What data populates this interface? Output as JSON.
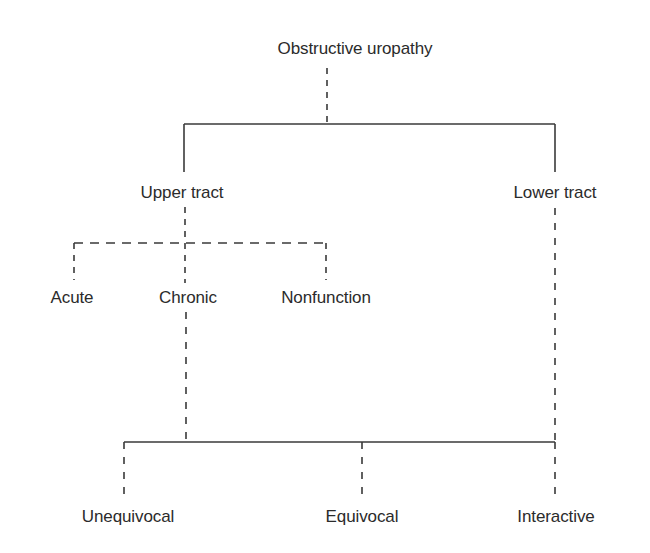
{
  "diagram": {
    "type": "tree",
    "colors": {
      "line": "#3a3a3a",
      "text": "#2b2b2b",
      "background": "#ffffff"
    },
    "nodes": {
      "root": {
        "label": "Obstructive uropathy",
        "x": 355,
        "y": 18
      },
      "upper": {
        "label": "Upper tract",
        "x": 182,
        "y": 182
      },
      "lower": {
        "label": "Lower tract",
        "x": 555,
        "y": 182
      },
      "acute": {
        "label": "Acute",
        "x": 72,
        "y": 287
      },
      "chronic": {
        "label": "Chronic",
        "x": 186,
        "y": 287
      },
      "nonfunction": {
        "label": "Nonfunction",
        "x": 326,
        "y": 287
      },
      "unequivocal": {
        "label": "Unequivocal",
        "x": 128,
        "y": 506
      },
      "equivocal": {
        "label": "Equivocal",
        "x": 362,
        "y": 506
      },
      "interactive": {
        "label": "Interactive",
        "x": 555,
        "y": 506
      }
    },
    "edges": [
      {
        "from": "root",
        "to": "upper",
        "style": "dashed-then-solid"
      },
      {
        "from": "root",
        "to": "lower",
        "style": "dashed-then-solid"
      },
      {
        "from": "upper",
        "to": "acute",
        "style": "dashed"
      },
      {
        "from": "upper",
        "to": "chronic",
        "style": "dashed"
      },
      {
        "from": "upper",
        "to": "nonfunction",
        "style": "dashed"
      },
      {
        "from": "chronic",
        "to": "unequivocal",
        "style": "dashed-to-solid-bar"
      },
      {
        "from": "lower",
        "to": "interactive",
        "style": "dashed-to-solid-bar"
      },
      {
        "from": "bottom-bar",
        "to": "equivocal",
        "style": "dashed"
      }
    ]
  }
}
